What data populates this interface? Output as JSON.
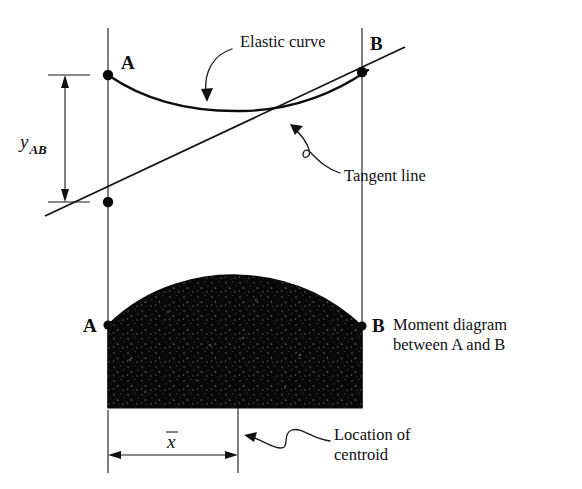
{
  "figure": {
    "title_present": false,
    "background_color": "#ffffff",
    "ink_color": "#111111",
    "labels": {
      "point_a_upper": "A",
      "point_b_upper": "B",
      "point_a_lower": "A",
      "point_b_lower": "B",
      "deviation_var": "y",
      "deviation_sub": "AB",
      "centroid_var": "x",
      "elastic_curve": "Elastic curve",
      "tangent_line": "Tangent line",
      "moment_diagram_line1": "Moment diagram",
      "moment_diagram_line2": "between A and B",
      "location_line1": "Location of",
      "location_line2": "centroid"
    },
    "geometry": {
      "support_line_a_x": 108,
      "support_line_b_x": 362,
      "point_a_y": 75,
      "point_b_y": 72,
      "tangent_at_a_line_y": 202,
      "dimension_line_x": 65,
      "moment_baseline_y": 408,
      "moment_top_a_y": 325,
      "moment_peak_y": 289,
      "centroid_x": 238,
      "xbar_dim_y": 455
    }
  }
}
